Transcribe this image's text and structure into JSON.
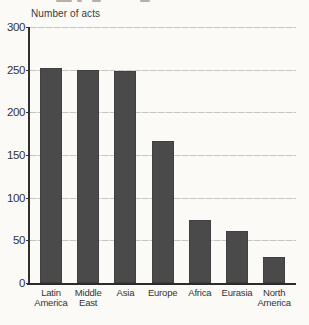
{
  "chart_data": {
    "type": "bar",
    "title": "Number of acts",
    "categories": [
      "Latin America",
      "Middle East",
      "Asia",
      "Europe",
      "Africa",
      "Eurasia",
      "North America"
    ],
    "category_lines": [
      [
        "Latin",
        "America"
      ],
      [
        "Middle",
        "East"
      ],
      [
        "Asia"
      ],
      [
        "Europe"
      ],
      [
        "Africa"
      ],
      [
        "Eurasia"
      ],
      [
        "North",
        "America"
      ]
    ],
    "values": [
      252,
      250,
      248,
      166,
      74,
      61,
      31
    ],
    "xlabel": "",
    "ylabel": "Number of acts",
    "ylim": [
      0,
      300
    ],
    "ytick_step": 50,
    "yticks": [
      300,
      250,
      200,
      150,
      100,
      50,
      0
    ],
    "ytick_labels": [
      "300",
      "250",
      "200",
      "150",
      "100",
      "50",
      "0"
    ],
    "grid": true,
    "legend": "none",
    "bar_color": "#4a4a4a",
    "grid_color": "#c9c6bf",
    "axis_color": "#333130",
    "text_color": "#343434",
    "background_color": "#fbfaf6"
  }
}
